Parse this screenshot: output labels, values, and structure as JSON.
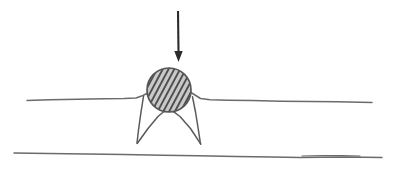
{
  "figure": {
    "background_color": "#ffffff",
    "width": 400,
    "height": 175,
    "ink_color": "#5a5a5a",
    "ink_color_dark": "#2b2b2b",
    "caption": ""
  },
  "force_arrow": {
    "label": "",
    "direction": "down",
    "color": "#2b2b2b",
    "shaft": {
      "x1": 178,
      "y1": 11,
      "x2": 178.5,
      "y2": 52
    },
    "head": {
      "tip_x": 178.5,
      "tip_y": 62,
      "half_width": 4.2,
      "length": 11
    },
    "stroke_width": 2.1
  },
  "disk": {
    "label": "",
    "center_x": 169,
    "center_y": 90,
    "radius_x": 22,
    "radius_y": 22,
    "fill_color": "#c9c9c9",
    "outline_color": "#565656",
    "outline_width": 1.7,
    "hatch": {
      "color": "#4e4e4e",
      "width": 1.9,
      "angle_degrees": 62,
      "spacing": 5.1,
      "count": 15
    }
  },
  "upper_line": {
    "label": "",
    "color": "#6b6b6b",
    "stroke_width": 1.5,
    "left_segment_points": "27,100.5 50,99.8 78,99.3 104,98.8 124,98.6 136,98.0 143,95.5 148.5,92.5",
    "right_segment_points": "190,92.0 195,95.0 200.5,98.5 210,99.8 228,100.2 252,100.6 281,101.2 310,101.6 338,101.8 360,102.2 372,102.6"
  },
  "legs": {
    "label": "",
    "color": "#5a5a5a",
    "stroke_width": 1.5,
    "left_leg_outer": "143.5,96.5 141.0,112.0 138.5,130.0 137.0,143.0",
    "left_leg_inner": "137.2,143.5 148.0,128.5 158.0,116.5 165.0,110.5",
    "right_leg_outer": "192.5,96.8 195.5,112.0 198.5,130.5 200.5,144.0",
    "right_leg_inner": "200.8,144.2 190.5,128.5 180.0,116.5 172.5,110.8"
  },
  "lower_line": {
    "label": "",
    "color": "#6b6b6b",
    "stroke_width": 1.5,
    "points": "14,153.0 48,153.6 86,154.0 124,154.6 162,155.2 198,155.8 236,156.4 272,157.0 300,157.4 322,157.2 344,157.0 364,157.3 382,157.6",
    "overlap_points": "302,156.0 322,155.6 342,155.6 360,156.0"
  }
}
